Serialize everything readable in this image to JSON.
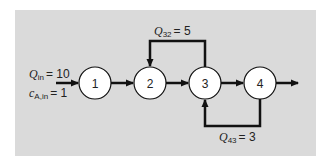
{
  "diagram": {
    "type": "reactor-network",
    "panel_color": "#dadada",
    "line_color": "#111111",
    "nodes": [
      {
        "id": "1",
        "label": "1"
      },
      {
        "id": "2",
        "label": "2"
      },
      {
        "id": "3",
        "label": "3"
      },
      {
        "id": "4",
        "label": "4"
      }
    ],
    "inlet": {
      "flow_symbol": "Q",
      "flow_sub": "in",
      "flow_value": "= 10",
      "conc_symbol": "c",
      "conc_sub": "A,in",
      "conc_value": "= 1"
    },
    "recycle_top": {
      "symbol": "Q",
      "sub": "32",
      "value": "= 5",
      "from": "3",
      "to": "2"
    },
    "recycle_bottom": {
      "symbol": "Q",
      "sub": "43",
      "value": "= 3",
      "from": "4",
      "to": "3"
    },
    "edges": [
      {
        "from": "inlet",
        "to": "1"
      },
      {
        "from": "1",
        "to": "2"
      },
      {
        "from": "2",
        "to": "3"
      },
      {
        "from": "3",
        "to": "4"
      },
      {
        "from": "4",
        "to": "outlet"
      }
    ]
  }
}
